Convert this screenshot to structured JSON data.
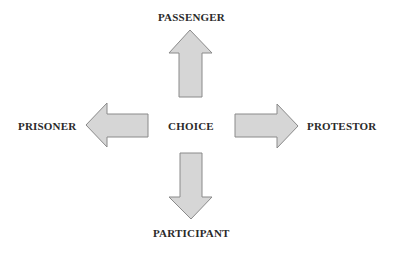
{
  "diagram": {
    "center": {
      "label": "CHOICE"
    },
    "nodes": [
      {
        "id": "top",
        "label": "PASSENGER",
        "direction": "up"
      },
      {
        "id": "left",
        "label": "PRISONER",
        "direction": "left"
      },
      {
        "id": "right",
        "label": "PROTESTOR",
        "direction": "right"
      },
      {
        "id": "bottom",
        "label": "PARTICIPANT",
        "direction": "down"
      }
    ],
    "colors": {
      "arrow_fill": "#d6d6d6",
      "arrow_stroke": "#8a8a8a",
      "text": "#2a2a2a",
      "background": "#ffffff"
    }
  }
}
